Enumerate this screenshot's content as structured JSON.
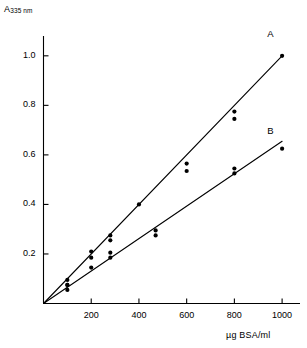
{
  "chart_data": {
    "type": "scatter",
    "title": "",
    "subtitle": "",
    "xlabel": "µg BSA/ml",
    "ylabel": "A 335 nm",
    "ylabel_main": "A",
    "ylabel_sub": "335 nm",
    "xlim": [
      0,
      1075
    ],
    "ylim": [
      0,
      1.08
    ],
    "xticks": [
      200,
      400,
      600,
      800,
      1000
    ],
    "xtick_labels": [
      "200",
      "400",
      "600",
      "800",
      "1000"
    ],
    "yticks": [
      0.2,
      0.4,
      0.6,
      0.8,
      1.0
    ],
    "ytick_labels": [
      "0.2",
      "0.4",
      "0.6",
      "0.8",
      "1.0"
    ],
    "grid": false,
    "legend_position": "inline-end-of-line",
    "series": [
      {
        "name": "A",
        "label": "A",
        "label_x": 955,
        "label_y": 1.055,
        "marker": "filled-circle",
        "color": "#000000",
        "fit_line": {
          "x0": 0,
          "y0": 0.0,
          "x1": 1000,
          "y1": 1.0
        },
        "x": [
          100,
          100,
          200,
          200,
          280,
          280,
          400,
          600,
          600,
          800,
          800,
          1000
        ],
        "y": [
          0.075,
          0.095,
          0.185,
          0.21,
          0.255,
          0.275,
          0.4,
          0.535,
          0.565,
          0.745,
          0.775,
          1.0
        ]
      },
      {
        "name": "B",
        "label": "B",
        "label_x": 955,
        "label_y": 0.665,
        "marker": "filled-circle",
        "color": "#000000",
        "fit_line": {
          "x0": 0,
          "y0": 0.0,
          "x1": 1000,
          "y1": 0.655
        },
        "x": [
          100,
          100,
          200,
          280,
          280,
          470,
          470,
          800,
          800,
          1000
        ],
        "y": [
          0.055,
          0.075,
          0.145,
          0.185,
          0.205,
          0.275,
          0.295,
          0.525,
          0.545,
          0.625
        ]
      }
    ]
  },
  "axes": {
    "y_title_main": "A",
    "y_title_sub": "335 nm",
    "x_title": "µg BSA/ml"
  },
  "labels": {
    "curve_a": "A",
    "curve_b": "B"
  }
}
